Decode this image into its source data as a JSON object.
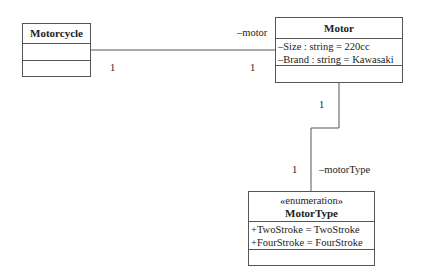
{
  "diagram": {
    "type": "UML class diagram",
    "classes": {
      "motorcycle": {
        "name": "Motorcycle",
        "attributes": [],
        "operations": []
      },
      "motor": {
        "name": "Motor",
        "attributes": [
          "–Size : string = 220cc",
          "–Brand : string = Kawasaki"
        ],
        "operations": []
      },
      "motor_type": {
        "stereotype": "«enumeration»",
        "name": "MotorType",
        "literals": [
          "+TwoStroke = TwoStroke",
          "+FourStroke = FourStroke"
        ],
        "operations": []
      }
    },
    "associations": [
      {
        "from": "Motorcycle",
        "to": "Motor",
        "role": "–motor",
        "source_multiplicity": "1",
        "target_multiplicity": "1"
      },
      {
        "from": "Motor",
        "to": "MotorType",
        "role": "–motorType",
        "source_multiplicity": "1",
        "target_multiplicity": "1"
      }
    ],
    "colors": {
      "line": "#555555",
      "text": "#222222",
      "background": "#ffffff"
    }
  }
}
